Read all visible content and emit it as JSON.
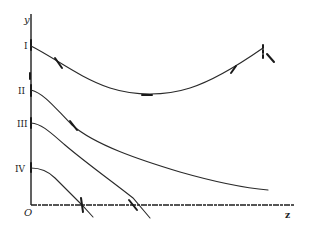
{
  "diagram": {
    "axes": {
      "y_label": "y",
      "x_label": "z",
      "origin_label": "O"
    },
    "curves": [
      {
        "id": "I",
        "label": "I",
        "shape": "U-shaped, descends then rises"
      },
      {
        "id": "II",
        "label": "II",
        "shape": "monotonically decreasing, asymptotic"
      },
      {
        "id": "III",
        "label": "III",
        "shape": "decreasing, crosses z-axis"
      },
      {
        "id": "IV",
        "label": "IV",
        "shape": "decreasing, crosses z-axis"
      }
    ],
    "colors": {
      "line": "#2a2a2a",
      "background": "#ffffff"
    }
  }
}
